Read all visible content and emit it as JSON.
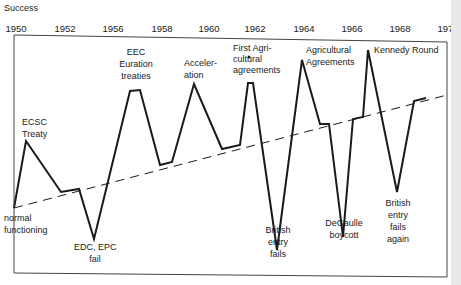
{
  "chart_data": {
    "type": "line",
    "title": "",
    "ylabel": "Success",
    "xlabel": "",
    "x_ticks": [
      "1950",
      "1952",
      "1956",
      "1958",
      "1960",
      "1962",
      "1964",
      "1966",
      "1968",
      "1970"
    ],
    "grid": false,
    "legend": null,
    "series": [
      {
        "name": "European integration success",
        "style": "solid",
        "points_px": [
          [
            14,
            208
          ],
          [
            26,
            141
          ],
          [
            61,
            192
          ],
          [
            79,
            189
          ],
          [
            94,
            239
          ],
          [
            130,
            91
          ],
          [
            140,
            90
          ],
          [
            160,
            165
          ],
          [
            172,
            162
          ],
          [
            194,
            84
          ],
          [
            222,
            149
          ],
          [
            240,
            145
          ],
          [
            248,
            83
          ],
          [
            253,
            83
          ],
          [
            277,
            250
          ],
          [
            302,
            60
          ],
          [
            320,
            124
          ],
          [
            329,
            124
          ],
          [
            343,
            237
          ],
          [
            353,
            119
          ],
          [
            363,
            117
          ],
          [
            368,
            50
          ],
          [
            397,
            192
          ],
          [
            414,
            101
          ],
          [
            426,
            98
          ]
        ]
      },
      {
        "name": "Trend",
        "style": "dashed",
        "points_px": [
          [
            14,
            208
          ],
          [
            447,
            95
          ]
        ]
      }
    ],
    "annotations": [
      {
        "id": "normal",
        "lines": [
          "normal",
          "functioning"
        ]
      },
      {
        "id": "ecsc",
        "lines": [
          "ECSC",
          "Treaty"
        ]
      },
      {
        "id": "edc",
        "lines": [
          "EDC, EPC",
          "fail"
        ]
      },
      {
        "id": "eec",
        "lines": [
          "EEC",
          "Euration",
          "treaties"
        ]
      },
      {
        "id": "accel",
        "lines": [
          "Acceler-",
          "ation"
        ]
      },
      {
        "id": "firstagri",
        "lines": [
          "First Agri-",
          "cultural",
          "agreements"
        ]
      },
      {
        "id": "british1",
        "lines": [
          "British",
          "entry",
          "fails"
        ]
      },
      {
        "id": "agri",
        "lines": [
          "Agricultural",
          "Agreements"
        ]
      },
      {
        "id": "degaulle",
        "lines": [
          "DeGaulle",
          "boycott"
        ]
      },
      {
        "id": "kennedy",
        "lines": [
          "Kennedy Round"
        ]
      },
      {
        "id": "british2",
        "lines": [
          "British",
          "entry",
          "fails",
          "again"
        ]
      }
    ]
  },
  "ylabel": "Success",
  "ticks": [
    {
      "label": "1950",
      "x": 16
    },
    {
      "label": "1952",
      "x": 65
    },
    {
      "label": "1956",
      "x": 113
    },
    {
      "label": "1958",
      "x": 162
    },
    {
      "label": "1960",
      "x": 209
    },
    {
      "label": "1962",
      "x": 255
    },
    {
      "label": "1964",
      "x": 304
    },
    {
      "label": "1966",
      "x": 352
    },
    {
      "label": "1968",
      "x": 400
    },
    {
      "label": "1970",
      "x": 448
    }
  ],
  "annotations": {
    "normal": [
      "normal",
      "functioning"
    ],
    "ecsc": [
      "ECSC",
      "Treaty"
    ],
    "edc": [
      "EDC, EPC",
      "fail"
    ],
    "eec": [
      "EEC",
      "Euration",
      "treaties"
    ],
    "accel": [
      "Acceler-",
      "ation"
    ],
    "firstagri": [
      "First Agri-",
      "cultural",
      "agreements"
    ],
    "british1": [
      "British",
      "entry",
      "fails"
    ],
    "agri": [
      "Agricultural",
      "Agreements"
    ],
    "degaulle": [
      "DeGaulle",
      "boycott"
    ],
    "kennedy": [
      "Kennedy Round"
    ],
    "british2": [
      "British",
      "entry",
      "fails",
      "again"
    ]
  },
  "colors": {
    "line": "#1a1a1a",
    "frame": "#444444",
    "background": "#ffffff"
  }
}
